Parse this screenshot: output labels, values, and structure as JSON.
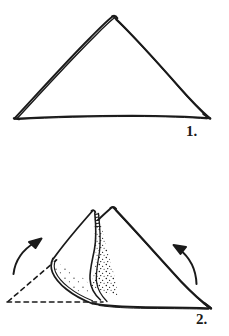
{
  "document": {
    "kind": "origami-instruction-diagram",
    "title": "",
    "background_color": "#ffffff",
    "ink_color": "#1a1a1a",
    "width": 229,
    "height": 336
  },
  "steps": [
    {
      "number_label": "1.",
      "caption": "",
      "figure_name": "folded-triangle",
      "description": "Plain triangle of folded paper seen edge on"
    },
    {
      "number_label": "2.",
      "caption": "",
      "figure_name": "triangle-with-opened-flap",
      "description": "Triangle with left layer pulled open, stippled inner surface, dashed previous outline and two curved fold arrows"
    }
  ],
  "annotations": {
    "arrow_left_name": "fold-arrow-left",
    "arrow_right_name": "fold-arrow-right",
    "dashed_line_name": "previous-position-dashed-outline",
    "shading_name": "stippled-inner-surface"
  }
}
